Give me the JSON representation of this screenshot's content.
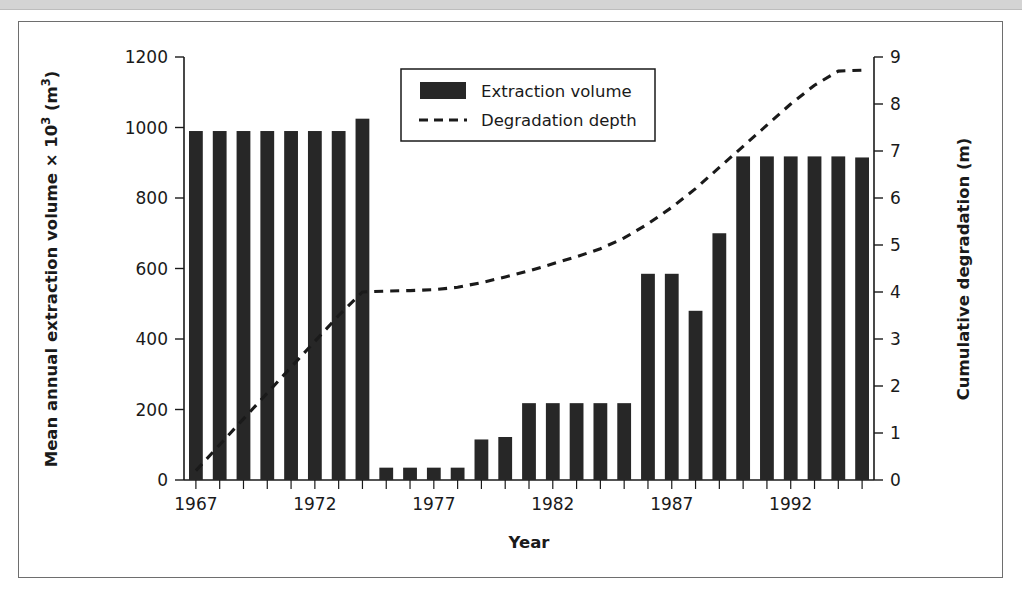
{
  "figure": {
    "frame_border_color": "#6e6e6e",
    "background_color": "#ffffff",
    "top_band_color": "#d4d4d4"
  },
  "chart_data": {
    "type": "bar",
    "title": "",
    "subtitle": "",
    "xlabel": "Year",
    "ylabel": "Mean annual extraction volume × 10³ (m³)",
    "y2label": "Cumulative degradation (m)",
    "ylim": [
      0,
      1200
    ],
    "y2lim": [
      0,
      9
    ],
    "xlim": [
      1966.5,
      1995.5
    ],
    "grid": false,
    "legend_position": "top-center",
    "y_ticks": [
      0,
      200,
      400,
      600,
      800,
      1000,
      1200
    ],
    "y_tick_labels": [
      "0",
      "200",
      "400",
      "600",
      "800",
      "1000",
      "1200"
    ],
    "y2_ticks": [
      0,
      1,
      2,
      3,
      4,
      5,
      6,
      7,
      8,
      9
    ],
    "y2_tick_labels": [
      "0",
      "1",
      "2",
      "3",
      "4",
      "5",
      "6",
      "7",
      "8",
      "9"
    ],
    "x_ticks": [
      1967,
      1972,
      1977,
      1982,
      1987,
      1992
    ],
    "x_tick_labels": [
      "1967",
      "1972",
      "1977",
      "1982",
      "1987",
      "1992"
    ],
    "categories": [
      1967,
      1968,
      1969,
      1970,
      1971,
      1972,
      1973,
      1974,
      1975,
      1976,
      1977,
      1978,
      1979,
      1980,
      1981,
      1982,
      1983,
      1984,
      1985,
      1986,
      1987,
      1988,
      1989,
      1990,
      1991,
      1992,
      1993,
      1994,
      1995
    ],
    "series": [
      {
        "name": "Extraction volume",
        "type": "bar",
        "axis": "left",
        "units": "×10³ m³",
        "color": "#272727",
        "values": [
          990,
          990,
          990,
          990,
          990,
          990,
          990,
          1025,
          35,
          35,
          35,
          35,
          115,
          122,
          218,
          218,
          218,
          218,
          218,
          585,
          585,
          480,
          700,
          918,
          918,
          918,
          918,
          918,
          915
        ]
      },
      {
        "name": "Degradation depth",
        "type": "line",
        "style": "dashed",
        "axis": "right",
        "units": "m",
        "color": "#1a1a1a",
        "values": [
          0.2,
          0.75,
          1.3,
          1.85,
          2.4,
          2.95,
          3.5,
          4.0,
          4.02,
          4.03,
          4.05,
          4.1,
          4.2,
          4.32,
          4.45,
          4.6,
          4.75,
          4.92,
          5.15,
          5.45,
          5.8,
          6.2,
          6.65,
          7.1,
          7.55,
          8.0,
          8.4,
          8.7,
          8.72
        ]
      }
    ]
  },
  "legend": {
    "entries": [
      {
        "label": "Extraction volume",
        "marker": "bar-swatch"
      },
      {
        "label": "Degradation depth",
        "marker": "dashed-line"
      }
    ]
  }
}
